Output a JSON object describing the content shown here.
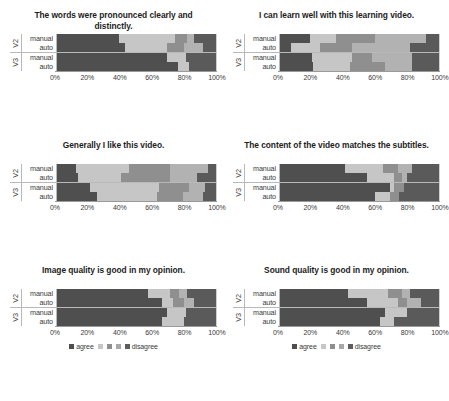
{
  "figure": {
    "group_label_top": "V2",
    "group_label_bottom": "V3",
    "row_label_manual": "manual",
    "row_label_auto": "auto",
    "x_ticks": [
      "0%",
      "20%",
      "40%",
      "60%",
      "80%",
      "100%"
    ],
    "legend": {
      "first_label": "agree",
      "last_label": "disagree",
      "swatch_colors": [
        "#4f4f4f",
        "#c6c6c6",
        "#8f8f8f",
        "#a8a8a8",
        "#5e5e5e"
      ]
    },
    "palette": {
      "agree": "#4f4f4f",
      "s2": "#c6c6c6",
      "s3": "#8f8f8f",
      "s4": "#b2b2b2",
      "disagree": "#5a5a5a"
    }
  },
  "chart_data": [
    {
      "type": "bar",
      "orientation": "horizontal",
      "stacked": true,
      "normalized": true,
      "title": "The words were pronounced clearly and distinctly.",
      "xlabel": "",
      "ylabel": "",
      "xlim": [
        0,
        100
      ],
      "grid": true,
      "legend_position": "bottom",
      "categories": [
        "V2 manual",
        "V2 auto",
        "V3 manual",
        "V3 auto"
      ],
      "series": [
        {
          "name": "agree",
          "values": [
            39,
            43,
            69,
            76
          ]
        },
        {
          "name": "2",
          "values": [
            35,
            26,
            12,
            7
          ]
        },
        {
          "name": "3",
          "values": [
            8,
            11,
            0,
            0
          ]
        },
        {
          "name": "4",
          "values": [
            4,
            12,
            0,
            0
          ]
        },
        {
          "name": "disagree",
          "values": [
            14,
            8,
            19,
            17
          ]
        }
      ]
    },
    {
      "type": "bar",
      "orientation": "horizontal",
      "stacked": true,
      "normalized": true,
      "title": "I can learn well with this learning video.",
      "xlabel": "",
      "ylabel": "",
      "xlim": [
        0,
        100
      ],
      "grid": true,
      "legend_position": "bottom",
      "categories": [
        "V2 manual",
        "V2 auto",
        "V3 manual",
        "V3 auto"
      ],
      "series": [
        {
          "name": "agree",
          "values": [
            19,
            7,
            20,
            21
          ]
        },
        {
          "name": "2",
          "values": [
            16,
            18,
            25,
            23
          ]
        },
        {
          "name": "3",
          "values": [
            25,
            20,
            13,
            22
          ]
        },
        {
          "name": "4",
          "values": [
            32,
            37,
            25,
            17
          ]
        },
        {
          "name": "disagree",
          "values": [
            8,
            18,
            17,
            17
          ]
        }
      ]
    },
    {
      "type": "bar",
      "orientation": "horizontal",
      "stacked": true,
      "normalized": true,
      "title": "Generally I like this video.",
      "xlabel": "",
      "ylabel": "",
      "xlim": [
        0,
        100
      ],
      "grid": true,
      "legend_position": "bottom",
      "categories": [
        "V2 manual",
        "V2 auto",
        "V3 manual",
        "V3 auto"
      ],
      "series": [
        {
          "name": "agree",
          "values": [
            12,
            13,
            21,
            25
          ]
        },
        {
          "name": "2",
          "values": [
            33,
            27,
            43,
            38
          ]
        },
        {
          "name": "3",
          "values": [
            26,
            31,
            19,
            16
          ]
        },
        {
          "name": "4",
          "values": [
            24,
            17,
            10,
            13
          ]
        },
        {
          "name": "disagree",
          "values": [
            5,
            12,
            7,
            8
          ]
        }
      ]
    },
    {
      "type": "bar",
      "orientation": "horizontal",
      "stacked": true,
      "normalized": true,
      "title": "The content of the video matches the subtitles.",
      "xlabel": "",
      "ylabel": "",
      "xlim": [
        0,
        100
      ],
      "grid": true,
      "legend_position": "bottom",
      "categories": [
        "V2 manual",
        "V2 auto",
        "V3 manual",
        "V3 auto"
      ],
      "series": [
        {
          "name": "agree",
          "values": [
            41,
            55,
            69,
            60
          ]
        },
        {
          "name": "2",
          "values": [
            24,
            17,
            3,
            9
          ]
        },
        {
          "name": "3",
          "values": [
            9,
            5,
            6,
            6
          ]
        },
        {
          "name": "4",
          "values": [
            9,
            3,
            0,
            0
          ]
        },
        {
          "name": "disagree",
          "values": [
            17,
            20,
            22,
            25
          ]
        }
      ]
    },
    {
      "type": "bar",
      "orientation": "horizontal",
      "stacked": true,
      "normalized": true,
      "title": "Image quality is good in my opinion.",
      "xlabel": "",
      "ylabel": "",
      "xlim": [
        0,
        100
      ],
      "grid": true,
      "legend_position": "bottom",
      "categories": [
        "V2 manual",
        "V2 auto",
        "V3 manual",
        "V3 auto"
      ],
      "series": [
        {
          "name": "agree",
          "values": [
            57,
            66,
            69,
            66
          ]
        },
        {
          "name": "2",
          "values": [
            14,
            7,
            12,
            14
          ]
        },
        {
          "name": "3",
          "values": [
            6,
            7,
            0,
            0
          ]
        },
        {
          "name": "4",
          "values": [
            5,
            6,
            0,
            0
          ]
        },
        {
          "name": "disagree",
          "values": [
            18,
            14,
            19,
            20
          ]
        }
      ]
    },
    {
      "type": "bar",
      "orientation": "horizontal",
      "stacked": true,
      "normalized": true,
      "title": "Sound quality is good in my opinion.",
      "xlabel": "",
      "ylabel": "",
      "xlim": [
        0,
        100
      ],
      "grid": true,
      "legend_position": "bottom",
      "categories": [
        "V2 manual",
        "V2 auto",
        "V3 manual",
        "V3 auto"
      ],
      "series": [
        {
          "name": "agree",
          "values": [
            43,
            55,
            66,
            63
          ]
        },
        {
          "name": "2",
          "values": [
            25,
            19,
            14,
            9
          ]
        },
        {
          "name": "3",
          "values": [
            9,
            6,
            0,
            0
          ]
        },
        {
          "name": "4",
          "values": [
            5,
            9,
            0,
            0
          ]
        },
        {
          "name": "disagree",
          "values": [
            18,
            11,
            20,
            28
          ]
        }
      ]
    }
  ]
}
